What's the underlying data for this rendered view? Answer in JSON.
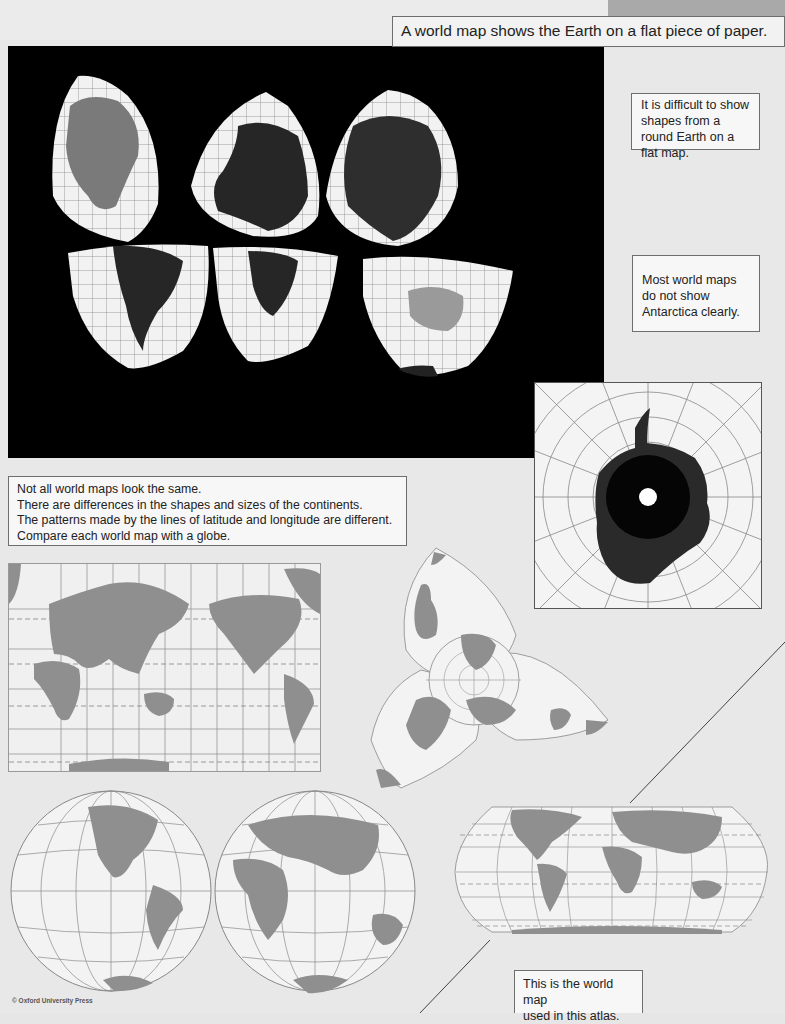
{
  "page": {
    "title": "A world map shows the Earth on a flat piece of paper.",
    "notes": {
      "round_earth": [
        "It is difficult to show",
        "shapes from a",
        "round Earth on a",
        "flat map."
      ],
      "antarctica": [
        "Most world maps",
        "do not show",
        "Antarctica clearly."
      ],
      "comparison": [
        "Not all world maps look the same.",
        "There are differences in the shapes and sizes of the continents.",
        "The patterns made by the lines of latitude and longitude are different.",
        "Compare each world map with a globe."
      ],
      "atlas_map": [
        "This is the world map",
        "used in this atlas."
      ]
    },
    "copyright": "© Oxford University Press"
  },
  "figures": {
    "globe_gores_photo": {
      "label": "Globe peeled into six segments on black background",
      "land_color": "#2b2b2b",
      "sea_color": "#f2f2f2"
    },
    "antarctica_polar_map": {
      "label": "Polar view of Antarctica",
      "land_color": "#1e1e1e"
    },
    "mercator_map": {
      "label": "Pacific-centred rectangular world map"
    },
    "interrupted_map": {
      "label": "Three-lobed interrupted world map"
    },
    "hemisphere_maps": {
      "label": "Western and Eastern hemispheres"
    },
    "atlas_projection_map": {
      "label": "Rounded rectangular world map used in this atlas"
    }
  },
  "colors": {
    "page_bg": "#e8e8e8",
    "map_land": "#8f8f8f",
    "map_sea": "#f3f3f3",
    "grid": "#8a8a8a",
    "tab": "#a9a9a9"
  }
}
